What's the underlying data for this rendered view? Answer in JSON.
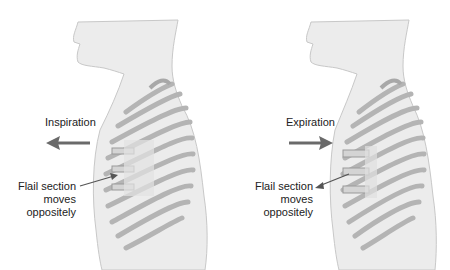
{
  "panels": [
    {
      "id": "inspiration",
      "phase_label": "Inspiration",
      "arrow_direction": "left",
      "flail_label": [
        "Flail section",
        "moves",
        "oppositely"
      ],
      "flail_motion": "inward"
    },
    {
      "id": "expiration",
      "phase_label": "Expiration",
      "arrow_direction": "right",
      "flail_label": [
        "Flail section",
        "moves",
        "oppositely"
      ],
      "flail_motion": "outward"
    }
  ],
  "colors": {
    "skin_fill": "#ececec",
    "skin_outline": "#bdbdbd",
    "rib": "#b4b4b4",
    "arrow": "#6a6a6a",
    "text": "#222222"
  }
}
